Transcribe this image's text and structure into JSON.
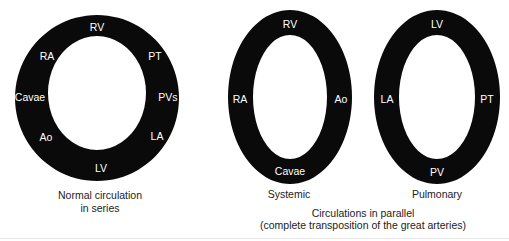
{
  "colors": {
    "ring": "#0a0a0a",
    "label": "#ffffff",
    "caption": "#222222",
    "background": "#ffffff"
  },
  "series_ring": {
    "labels": {
      "top": "RV",
      "upper_right": "PT",
      "right": "PVs",
      "lower_right": "LA",
      "bottom": "LV",
      "lower_left": "Ao",
      "left": "Cavae",
      "upper_left": "RA"
    },
    "caption_line1": "Normal circulation",
    "caption_line2": "in series"
  },
  "systemic_ring": {
    "labels": {
      "top": "RV",
      "right": "Ao",
      "bottom": "Cavae",
      "left": "RA"
    },
    "caption": "Systemic"
  },
  "pulmonary_ring": {
    "labels": {
      "top": "LV",
      "right": "PT",
      "bottom": "PV",
      "left": "LA"
    },
    "caption": "Pulmonary"
  },
  "parallel_caption": {
    "line1": "Circulations in parallel",
    "line2": "(complete transposition of the great arteries)"
  }
}
